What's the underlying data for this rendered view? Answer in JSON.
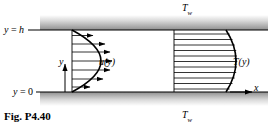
{
  "figure": {
    "caption": "Fig. P4.40",
    "labels": {
      "wall_top_temp": "T",
      "wall_top_temp_sub": "w",
      "wall_bottom_temp": "T",
      "wall_bottom_temp_sub": "w",
      "top_wall_position": "y = h",
      "bottom_wall_position": "y = 0",
      "y_axis": "y",
      "x_axis": "x",
      "velocity_profile": "u(y)",
      "temperature_profile": "T(y)"
    },
    "colors": {
      "line": "#000000",
      "wall_fill_dark": "#8a8a8a",
      "wall_fill_light": "#e8e8e8",
      "background": "#ffffff"
    },
    "geometry": {
      "channel_top_y": 30,
      "channel_bottom_y": 92,
      "channel_height_label": "h",
      "velocity_profile_base_x": 72,
      "velocity_profile_peak_x": 112,
      "temperature_profile_base_x": 174,
      "temperature_profile_peak_x": 230,
      "velocity_arrow_count": 7,
      "temperature_line_count": 11
    }
  }
}
